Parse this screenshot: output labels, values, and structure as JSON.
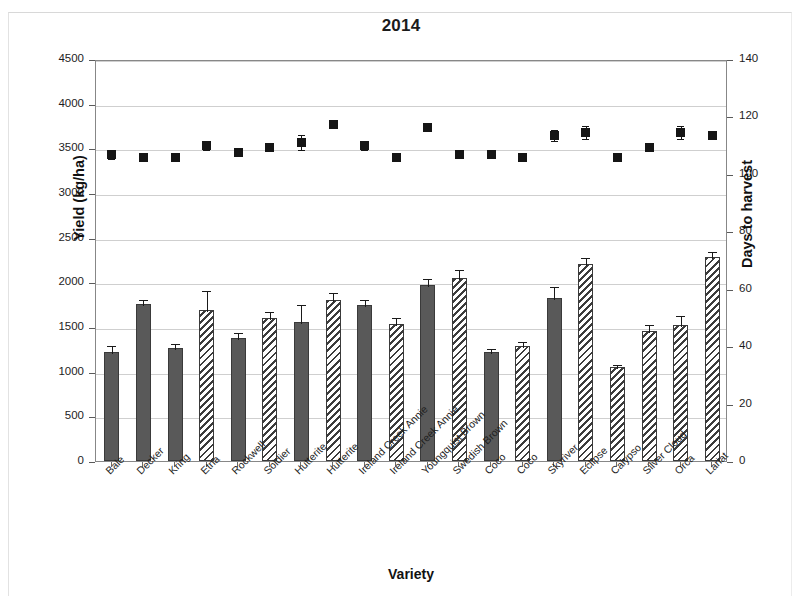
{
  "figure": {
    "title": "2014",
    "xlabel": "Variety",
    "ylabel_left": "Yield (kg/ha)",
    "ylabel_right": "Days to harvest"
  },
  "axes": {
    "left_ticks": [
      "4500",
      "4000",
      "3500",
      "3000",
      "2500",
      "2000",
      "1500",
      "1000",
      "500",
      "0"
    ],
    "right_ticks": [
      "140",
      "120",
      "100",
      "80",
      "60",
      "40",
      "20",
      "0"
    ]
  },
  "chart_data": {
    "type": "bar",
    "title": "2014",
    "xlabel": "Variety",
    "ylabel": "Yield (kg/ha)",
    "ylabel_secondary": "Days to harvest",
    "ylim": [
      0,
      4500
    ],
    "ylim_secondary": [
      0,
      140
    ],
    "grid": true,
    "legend": "none",
    "categories": [
      "Bale",
      "Decker",
      "Kring",
      "Etna",
      "Rockwell",
      "Soldier",
      "Hutterite",
      "Hutterite",
      "Ireland Creek Annie",
      "Ireland Creek Annie",
      "Youngquist Brown",
      "Swedish Brown",
      "Coco",
      "Coco",
      "Skyriver",
      "Eclipse",
      "Calypso",
      "Silver Cloud",
      "Orca",
      "Lariat"
    ],
    "series": [
      {
        "name": "Yield (kg/ha)",
        "axis": "left",
        "render": "bar",
        "fill": [
          "solid",
          "solid",
          "solid",
          "hatch",
          "solid",
          "hatch",
          "solid",
          "hatch",
          "solid",
          "hatch",
          "solid",
          "hatch",
          "solid",
          "hatch",
          "solid",
          "hatch",
          "hatch",
          "hatch",
          "hatch",
          "hatch"
        ],
        "values": [
          1225,
          1760,
          1270,
          1690,
          1375,
          1600,
          1555,
          1800,
          1745,
          1530,
          1975,
          2045,
          1215,
          1285,
          1820,
          2205,
          1055,
          1460,
          1525,
          2280
        ],
        "errors": [
          90,
          70,
          60,
          230,
          75,
          95,
          215,
          105,
          75,
          90,
          80,
          115,
          65,
          75,
          145,
          90,
          45,
          90,
          120,
          85
        ]
      },
      {
        "name": "Days to harvest",
        "axis": "right",
        "render": "scatter",
        "values": [
          107.5,
          106.5,
          106.5,
          110.5,
          108,
          110,
          111.5,
          118,
          110.5,
          106.5,
          117,
          107.5,
          107.5,
          106.5,
          114,
          115,
          106.5,
          110,
          115,
          114
        ],
        "errors": [
          1.6,
          0.5,
          0.5,
          1.4,
          0.8,
          1.5,
          2.6,
          0.6,
          1.6,
          0.5,
          0.6,
          1.2,
          0.9,
          0.5,
          2.0,
          2.2,
          0.5,
          1.0,
          2.2,
          1.1
        ]
      }
    ]
  }
}
